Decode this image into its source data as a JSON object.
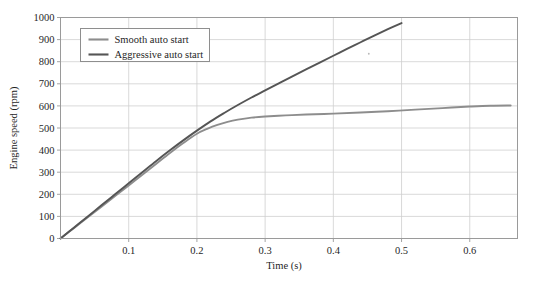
{
  "chart_data": {
    "type": "line",
    "title": "",
    "xlabel": "Time (s)",
    "ylabel": "Engine speed (rpm)",
    "xlim": [
      0,
      0.67
    ],
    "ylim": [
      0,
      1000
    ],
    "xticks": [
      0.1,
      0.2,
      0.3,
      0.4,
      0.5,
      0.6
    ],
    "xtick_labels": [
      "0.1",
      "0.2",
      "0.3",
      "0.4",
      "0.5",
      "0.6"
    ],
    "yticks": [
      0,
      100,
      200,
      300,
      400,
      500,
      600,
      700,
      800,
      900,
      1000
    ],
    "ytick_labels": [
      "0",
      "100",
      "200",
      "300",
      "400",
      "500",
      "600",
      "700",
      "800",
      "900",
      "1000"
    ],
    "grid": true,
    "grid_color": "#cfcfcf",
    "legend_position": "upper left",
    "series": [
      {
        "name": "Smooth auto start",
        "color": "#8d8d8d",
        "x": [
          0.0,
          0.02,
          0.04,
          0.06,
          0.08,
          0.1,
          0.12,
          0.14,
          0.16,
          0.18,
          0.2,
          0.215,
          0.23,
          0.245,
          0.26,
          0.28,
          0.3,
          0.33,
          0.36,
          0.4,
          0.44,
          0.48,
          0.52,
          0.56,
          0.6,
          0.63,
          0.66
        ],
        "y": [
          0,
          48,
          96,
          144,
          192,
          240,
          288,
          337,
          386,
          432,
          474,
          496,
          514,
          528,
          538,
          547,
          552,
          557,
          561,
          565,
          570,
          576,
          583,
          590,
          597,
          601,
          602
        ]
      },
      {
        "name": "Aggressive auto start",
        "color": "#555555",
        "x": [
          0.0,
          0.02,
          0.04,
          0.06,
          0.08,
          0.1,
          0.12,
          0.14,
          0.16,
          0.18,
          0.2,
          0.22,
          0.24,
          0.26,
          0.28,
          0.3,
          0.32,
          0.34,
          0.36,
          0.38,
          0.4,
          0.42,
          0.44,
          0.46,
          0.48,
          0.5
        ],
        "x_end": 0.5,
        "y": [
          0,
          50,
          100,
          150,
          200,
          250,
          300,
          350,
          398,
          444,
          488,
          530,
          568,
          604,
          638,
          670,
          702,
          734,
          765,
          796,
          827,
          858,
          888,
          918,
          947,
          975
        ]
      }
    ],
    "annotations": [
      {
        "name": "speck",
        "x": 0.452,
        "y": 836
      }
    ]
  },
  "legend": {
    "entries": [
      {
        "label": "Smooth auto start",
        "color": "#8d8d8d"
      },
      {
        "label": "Aggressive auto start",
        "color": "#555555"
      }
    ]
  },
  "axes": {
    "x_title": "Time (s)",
    "y_title": "Engine speed (rpm)"
  },
  "colors": {
    "background": "#ffffff",
    "frame": "#9a9a9a",
    "grid": "#cfcfcf",
    "text": "#1f1f1f",
    "smooth": "#8d8d8d",
    "aggressive": "#555555"
  }
}
